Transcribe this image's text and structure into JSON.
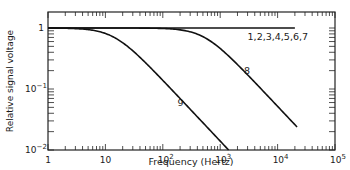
{
  "chart_data": {
    "type": "line",
    "title": "",
    "xlabel": "Frequency (Hertz)",
    "ylabel": "Relative signal voltage",
    "xscale": "log",
    "yscale": "log",
    "xlim": [
      1,
      100000
    ],
    "ylim": [
      0.01,
      2
    ],
    "grid": false,
    "legend": "none (inline curve labels)",
    "x_ticks": [
      {
        "value": 1,
        "label": "1"
      },
      {
        "value": 10,
        "label": "10"
      },
      {
        "value": 100,
        "label": "10^2"
      },
      {
        "value": 1000,
        "label": "10^3"
      },
      {
        "value": 10000,
        "label": "10^4"
      },
      {
        "value": 100000,
        "label": "10^5"
      }
    ],
    "y_ticks": [
      {
        "value": 1,
        "label": "1"
      },
      {
        "value": 0.1,
        "label": "10^-1"
      },
      {
        "value": 0.01,
        "label": "10^-2"
      }
    ],
    "series": [
      {
        "name": "1,2,3,4,5,6,7",
        "x": [
          1,
          10,
          100,
          1000,
          10000,
          20000
        ],
        "y": [
          1,
          1,
          1,
          1,
          1,
          1
        ]
      },
      {
        "name": "8",
        "x": [
          1,
          10,
          100,
          300,
          520,
          1000,
          3000,
          10000,
          21800
        ],
        "y": [
          1,
          1,
          0.98,
          0.87,
          0.71,
          0.46,
          0.17,
          0.052,
          0.024
        ]
      },
      {
        "name": "9",
        "x": [
          1,
          5,
          10,
          14,
          30,
          100,
          300,
          1000,
          1400
        ],
        "y": [
          1,
          0.94,
          0.81,
          0.71,
          0.42,
          0.14,
          0.047,
          0.014,
          0.01
        ]
      }
    ],
    "annotations": [
      {
        "text": "1,2,3,4,5,6,7",
        "x": 3000,
        "y": 0.7
      },
      {
        "text": "8",
        "x": 2600,
        "y": 0.2
      },
      {
        "text": "9",
        "x": 180,
        "y": 0.06
      }
    ]
  }
}
